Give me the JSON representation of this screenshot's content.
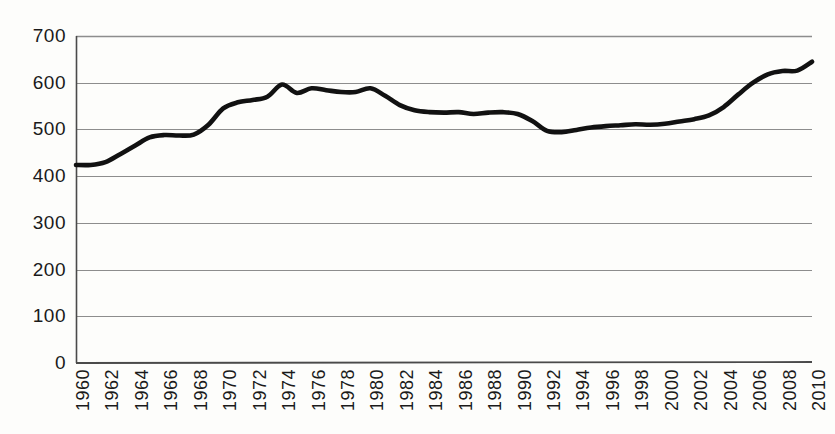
{
  "chart_data": {
    "type": "line",
    "title": "",
    "subtitle": "",
    "xlabel": "",
    "ylabel": "",
    "xlim": [
      1960,
      2010
    ],
    "ylim": [
      0,
      700
    ],
    "grid": true,
    "grid_axis": "y",
    "legend": false,
    "legend_position": "none",
    "line_color": "#111111",
    "grid_color": "#8d8d8d",
    "axis_color": "#4a4a4a",
    "background_color": "#fdfdfb",
    "y_ticks": [
      0,
      100,
      200,
      300,
      400,
      500,
      600,
      700
    ],
    "y_tick_labels": [
      "0",
      "100",
      "200",
      "300",
      "400",
      "500",
      "600",
      "700"
    ],
    "x_ticks": [
      1960,
      1962,
      1964,
      1966,
      1968,
      1970,
      1972,
      1974,
      1976,
      1978,
      1980,
      1982,
      1984,
      1986,
      1988,
      1990,
      1992,
      1994,
      1996,
      1998,
      2000,
      2002,
      2004,
      2006,
      2008,
      2010
    ],
    "x_tick_labels": [
      "1960",
      "1962",
      "1964",
      "1966",
      "1968",
      "1970",
      "1972",
      "1974",
      "1976",
      "1978",
      "1980",
      "1982",
      "1984",
      "1986",
      "1988",
      "1990",
      "1992",
      "1994",
      "1996",
      "1998",
      "2000",
      "2002",
      "2004",
      "2006",
      "2008",
      "2010"
    ],
    "x_tick_rotation": -90,
    "series": [
      {
        "name": "series-1",
        "color": "#111111",
        "x": [
          1960,
          1961,
          1962,
          1963,
          1964,
          1965,
          1966,
          1967,
          1968,
          1969,
          1970,
          1971,
          1972,
          1973,
          1974,
          1975,
          1976,
          1977,
          1978,
          1979,
          1980,
          1981,
          1982,
          1983,
          1984,
          1985,
          1986,
          1987,
          1988,
          1989,
          1990,
          1991,
          1992,
          1993,
          1994,
          1995,
          1996,
          1997,
          1998,
          1999,
          2000,
          2001,
          2002,
          2003,
          2004,
          2005,
          2006,
          2007,
          2008,
          2009,
          2010
        ],
        "values": [
          424,
          424,
          430,
          447,
          465,
          483,
          488,
          487,
          489,
          510,
          545,
          558,
          563,
          570,
          596,
          578,
          588,
          584,
          580,
          580,
          588,
          572,
          552,
          541,
          537,
          536,
          537,
          533,
          536,
          537,
          533,
          518,
          497,
          494,
          499,
          504,
          507,
          509,
          511,
          510,
          512,
          517,
          522,
          530,
          548,
          575,
          600,
          618,
          625,
          626,
          645
        ]
      }
    ]
  }
}
